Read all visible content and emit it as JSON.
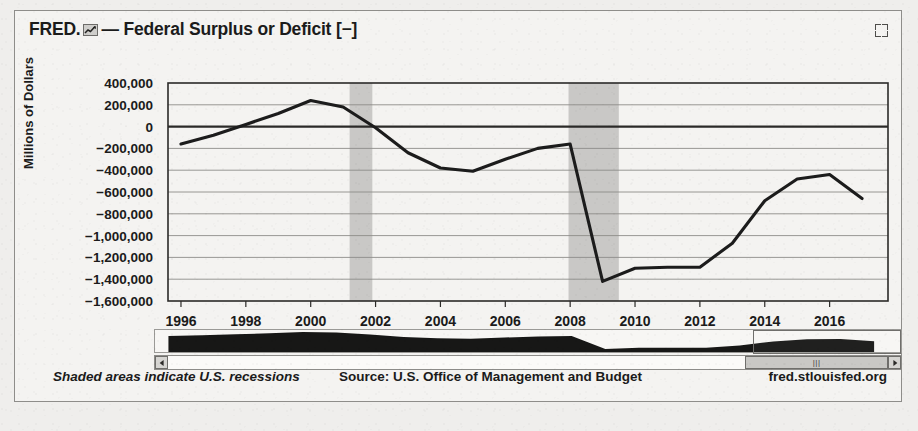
{
  "header": {
    "brand": "FRED.",
    "logo_icon": "fred-chart-icon",
    "series_title": "— Federal Surplus or Deficit [−]",
    "fullscreen_icon": "fullscreen-expand-icon"
  },
  "footer": {
    "recessions_note": "Shaded areas indicate U.S. recessions",
    "source": "Source: U.S. Office of Management and Budget",
    "url": "fred.stlouisfed.org"
  },
  "navigator": {
    "left_arrow_icon": "scroll-left-arrow-icon",
    "right_arrow_icon": "scroll-right-arrow-icon",
    "thumb_grip_icon": "drag-grip-icon",
    "thumb_grip_glyph": "|||",
    "selection_start_year": 2013.4,
    "selection_end_year": 2017.8
  },
  "colors": {
    "line": "#1c1c1c",
    "recession_band": "#c9c8c6",
    "gridline": "#8d8c89",
    "axis": "#2b2a28",
    "panel_background": "#f4f3f1",
    "page_background": "#efeeec"
  },
  "chart_data": {
    "type": "line",
    "title": "Federal Surplus or Deficit [−]",
    "xlabel": "",
    "ylabel": "Millions of Dollars",
    "xlim": [
      1995.6,
      2017.8
    ],
    "ylim": [
      -1600000,
      400000
    ],
    "grid": true,
    "legend": "none",
    "y_ticks": [
      400000,
      200000,
      0,
      -200000,
      -400000,
      -600000,
      -800000,
      -1000000,
      -1200000,
      -1400000,
      -1600000
    ],
    "y_tick_labels": [
      "400,000",
      "200,000",
      "0",
      "−200,000",
      "−400,000",
      "−600,000",
      "−800,000",
      "−1,000,000",
      "−1,200,000",
      "−1,400,000",
      "−1,600,000"
    ],
    "x_ticks": [
      1996,
      1998,
      2000,
      2002,
      2004,
      2006,
      2008,
      2010,
      2012,
      2014,
      2016
    ],
    "x_tick_labels": [
      "1996",
      "1998",
      "2000",
      "2002",
      "2004",
      "2006",
      "2008",
      "2010",
      "2012",
      "2014",
      "2016"
    ],
    "zero_line": 0,
    "series": [
      {
        "name": "Federal Surplus or Deficit [−]",
        "x": [
          1996,
          1997,
          1998,
          1999,
          2000,
          2001,
          2002,
          2003,
          2004,
          2005,
          2006,
          2007,
          2008,
          2009,
          2010,
          2011,
          2012,
          2013,
          2014,
          2015,
          2016,
          2017
        ],
        "values": [
          -160000,
          -80000,
          20000,
          120000,
          240000,
          180000,
          -10000,
          -240000,
          -380000,
          -410000,
          -300000,
          -200000,
          -160000,
          -1420000,
          -1300000,
          -1290000,
          -1290000,
          -1070000,
          -680000,
          -480000,
          -440000,
          -660000
        ]
      }
    ],
    "recession_bands": [
      {
        "start": 2001.2,
        "end": 2001.9
      },
      {
        "start": 2007.95,
        "end": 2009.5
      }
    ],
    "annotations": [
      "Shaded areas indicate U.S. recessions"
    ]
  }
}
